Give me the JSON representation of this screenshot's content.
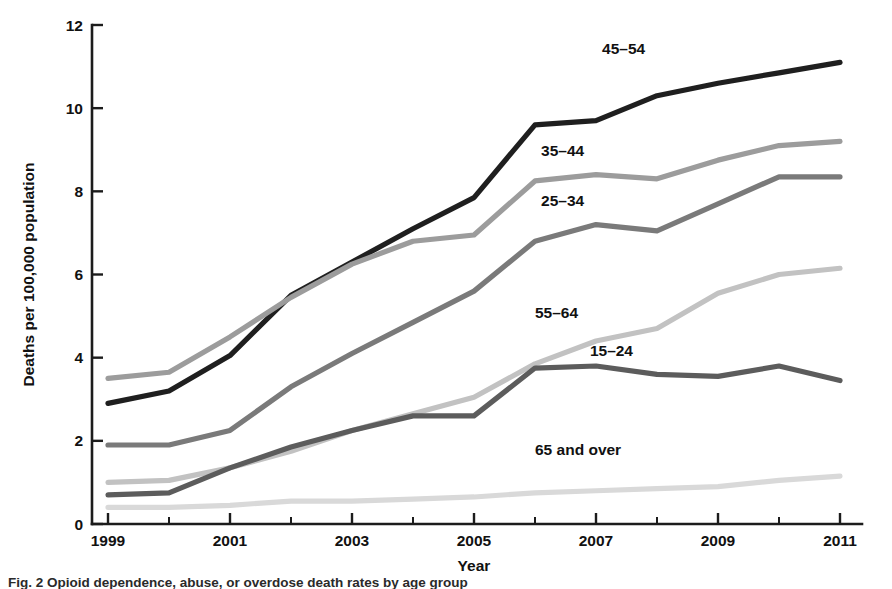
{
  "figure": {
    "caption": "Fig. 2  Opioid dependence, abuse, or overdose death rates by age group",
    "background_color": "#ffffff"
  },
  "chart_data": {
    "type": "line",
    "title": "",
    "xlabel": "Year",
    "ylabel": "Deaths per 100,000 population",
    "x": [
      1999,
      2000,
      2001,
      2002,
      2003,
      2004,
      2005,
      2006,
      2007,
      2008,
      2009,
      2010,
      2011
    ],
    "xlim": [
      1999,
      2011
    ],
    "ylim": [
      0,
      12
    ],
    "yticks": [
      0,
      2,
      4,
      6,
      8,
      10,
      12
    ],
    "xticks_major": [
      1999,
      2001,
      2003,
      2005,
      2007,
      2009,
      2011
    ],
    "xticks_minor": [
      2000,
      2002,
      2004,
      2006,
      2008,
      2010
    ],
    "xticklabels": [
      "1999",
      "",
      "2001",
      "",
      "2003",
      "",
      "2005",
      "",
      "2007",
      "",
      "2009",
      "",
      "2011"
    ],
    "yticklabels": [
      "0",
      "2",
      "4",
      "6",
      "8",
      "10",
      "12"
    ],
    "grid": false,
    "legend": "inline-labels",
    "series": [
      {
        "name": "45-54",
        "label": "45–54",
        "color": "#1f1f1f",
        "label_x": 2007.1,
        "label_y": 11.3,
        "values": [
          2.9,
          3.2,
          4.05,
          5.5,
          6.3,
          7.1,
          7.85,
          9.6,
          9.7,
          10.3,
          10.6,
          10.85,
          11.1
        ]
      },
      {
        "name": "35-44",
        "label": "35–44",
        "color": "#9c9c9c",
        "label_x": 2006.1,
        "label_y": 8.85,
        "values": [
          3.5,
          3.65,
          4.5,
          5.45,
          6.25,
          6.8,
          6.95,
          8.25,
          8.4,
          8.3,
          8.75,
          9.1,
          9.2
        ]
      },
      {
        "name": "25-34",
        "label": "25–34",
        "color": "#7a7a7a",
        "label_x": 2006.1,
        "label_y": 7.65,
        "values": [
          1.9,
          1.9,
          2.25,
          3.3,
          4.1,
          4.85,
          5.6,
          6.8,
          7.2,
          7.05,
          7.7,
          8.35,
          8.35
        ]
      },
      {
        "name": "55-64",
        "label": "55–64",
        "color": "#c2c2c2",
        "label_x": 2006.0,
        "label_y": 4.95,
        "values": [
          1.0,
          1.05,
          1.35,
          1.75,
          2.25,
          2.65,
          3.05,
          3.85,
          4.4,
          4.7,
          5.55,
          6.0,
          6.15
        ]
      },
      {
        "name": "15-24",
        "label": "15–24",
        "color": "#5c5c5c",
        "label_x": 2006.9,
        "label_y": 4.05,
        "values": [
          0.7,
          0.75,
          1.35,
          1.85,
          2.25,
          2.6,
          2.6,
          3.75,
          3.8,
          3.6,
          3.55,
          3.8,
          3.45
        ]
      },
      {
        "name": "65 and over",
        "label": "65 and over",
        "color": "#d9d9d9",
        "label_x": 2006.0,
        "label_y": 1.65,
        "values": [
          0.4,
          0.4,
          0.45,
          0.55,
          0.55,
          0.6,
          0.65,
          0.75,
          0.8,
          0.85,
          0.9,
          1.05,
          1.15
        ]
      }
    ]
  }
}
